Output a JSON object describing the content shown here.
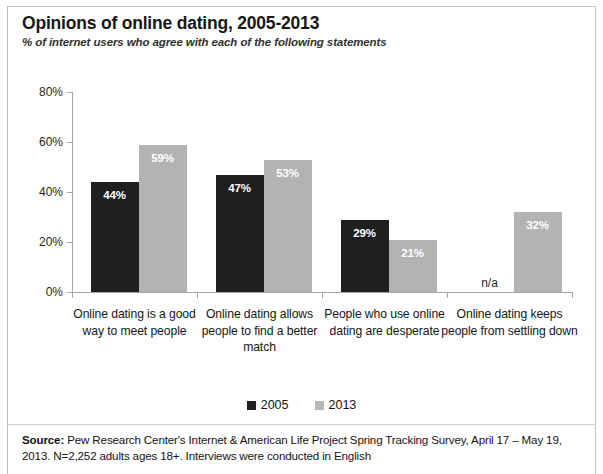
{
  "header": {
    "title": "Opinions of online dating, 2005-2013",
    "subtitle": "% of internet users who agree with each of the following statements"
  },
  "legend": {
    "items": [
      {
        "label": "2005",
        "color": "#201f1f"
      },
      {
        "label": "2013",
        "color": "#b8b8b8"
      }
    ]
  },
  "source": {
    "prefix": "Source:",
    "text": " Pew Research Center's Internet & American Life Project Spring Tracking Survey, April 17 – May 19, 2013. N=2,252 adults ages 18+. Interviews were conducted in English"
  },
  "chart_data": {
    "type": "bar",
    "title": "Opinions of online dating, 2005-2013",
    "subtitle": "% of internet users who agree with each of the following statements",
    "xlabel": "",
    "ylabel": "",
    "ylim": [
      0,
      80
    ],
    "yticks": [
      0,
      20,
      40,
      60,
      80
    ],
    "ytick_labels": [
      "0%",
      "20%",
      "40%",
      "60%",
      "80%"
    ],
    "grid": false,
    "legend_position": "bottom",
    "categories": [
      "Online dating is a good way to meet people",
      "Online dating allows people to find a better match",
      "People who use online dating are desperate",
      "Online dating keeps people from settling down"
    ],
    "series": [
      {
        "name": "2005",
        "color": "#201f1f",
        "values": [
          44,
          47,
          29,
          null
        ],
        "labels": [
          "44%",
          "47%",
          "29%",
          "n/a"
        ]
      },
      {
        "name": "2013",
        "color": "#b3b3b3",
        "values": [
          59,
          53,
          21,
          32
        ],
        "labels": [
          "59%",
          "53%",
          "21%",
          "32%"
        ]
      }
    ]
  }
}
